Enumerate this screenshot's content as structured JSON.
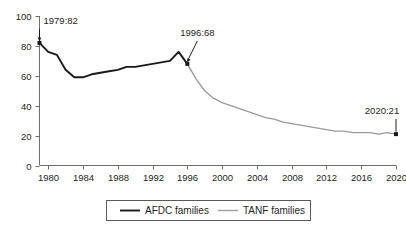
{
  "chart_data": {
    "type": "line",
    "title": "",
    "subtitle": "",
    "xlabel": "",
    "ylabel": "",
    "xlim": [
      1979,
      2020
    ],
    "ylim": [
      0,
      100
    ],
    "grid": false,
    "legend_position": "bottom-center",
    "y_ticks": [
      "0",
      "20",
      "40",
      "60",
      "80",
      "100"
    ],
    "y_tick_values": [
      0,
      20,
      40,
      60,
      80,
      100
    ],
    "x_ticks": [
      "1980",
      "1984",
      "1988",
      "1992",
      "1996",
      "2000",
      "2004",
      "2008",
      "2012",
      "2016",
      "2020"
    ],
    "x_tick_values": [
      1980,
      1984,
      1988,
      1992,
      1996,
      2000,
      2004,
      2008,
      2012,
      2016,
      2020
    ],
    "series": [
      {
        "name": "AFDC families",
        "color": "#1a1a1a",
        "x": [
          1979,
          1980,
          1981,
          1982,
          1983,
          1984,
          1985,
          1986,
          1987,
          1988,
          1989,
          1990,
          1991,
          1992,
          1993,
          1994,
          1995,
          1996
        ],
        "values": [
          82,
          76,
          74,
          64,
          59,
          59,
          61,
          62,
          63,
          64,
          66,
          66,
          67,
          68,
          69,
          70,
          76,
          68
        ]
      },
      {
        "name": "TANF families",
        "color": "#9a9a9a",
        "x": [
          1996,
          1997,
          1998,
          1999,
          2000,
          2001,
          2002,
          2003,
          2004,
          2005,
          2006,
          2007,
          2008,
          2009,
          2010,
          2011,
          2012,
          2013,
          2014,
          2015,
          2016,
          2017,
          2018,
          2019,
          2020
        ],
        "values": [
          68,
          58,
          50,
          45,
          42,
          40,
          38,
          36,
          34,
          32,
          31,
          29,
          28,
          27,
          26,
          25,
          24,
          23,
          23,
          22,
          22,
          22,
          21,
          22,
          21
        ]
      }
    ],
    "annotations": [
      {
        "label": "1979:82",
        "x": 1979,
        "y": 82
      },
      {
        "label": "1996:68",
        "x": 1996,
        "y": 68
      },
      {
        "label": "2020:21",
        "x": 2020,
        "y": 21
      }
    ],
    "legend": [
      {
        "label": "AFDC families",
        "color": "#1a1a1a"
      },
      {
        "label": "TANF families",
        "color": "#9a9a9a"
      }
    ]
  }
}
